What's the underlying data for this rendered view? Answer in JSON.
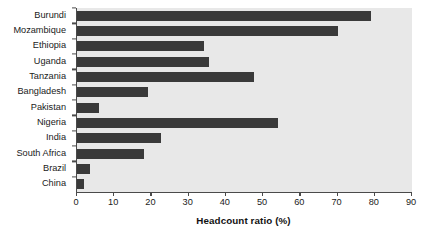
{
  "chart_data": {
    "type": "bar",
    "orientation": "horizontal",
    "title": "",
    "subtitle": "",
    "xlabel": "Headcount ratio (%)",
    "ylabel": "",
    "categories": [
      "Burundi",
      "Mozambique",
      "Ethiopia",
      "Uganda",
      "Tanzania",
      "Bangladesh",
      "Pakistan",
      "Nigeria",
      "India",
      "South Africa",
      "Brazil",
      "China"
    ],
    "values": [
      79,
      70,
      34,
      35.5,
      47.5,
      19,
      6,
      54,
      22.5,
      18,
      3.5,
      2
    ],
    "xlim": [
      0,
      90
    ],
    "xticks": [
      0,
      10,
      20,
      30,
      40,
      50,
      60,
      70,
      80,
      90
    ],
    "xticklabels": [
      "0",
      "10",
      "20",
      "30",
      "40",
      "50",
      "60",
      "70",
      "80",
      "90"
    ],
    "grid": false,
    "legend": null,
    "annotations": []
  },
  "style": {
    "bar_color": "#3a3a3a",
    "plot_background": "#e8e8e8",
    "figure_background": "#ffffff",
    "axis_color": "#4a4a4a",
    "text_color": "#1a1a1a"
  }
}
